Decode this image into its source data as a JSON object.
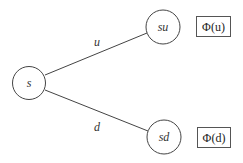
{
  "diagram": {
    "type": "binomial-tree",
    "nodes": [
      {
        "id": "s",
        "label": "s"
      },
      {
        "id": "su",
        "label": "su"
      },
      {
        "id": "sd",
        "label": "sd"
      }
    ],
    "edges": [
      {
        "from": "s",
        "to": "su",
        "label": "u"
      },
      {
        "from": "s",
        "to": "sd",
        "label": "d"
      }
    ],
    "payoffs": [
      {
        "node": "su",
        "label": "Φ(u)"
      },
      {
        "node": "sd",
        "label": "Φ(d)"
      }
    ]
  }
}
